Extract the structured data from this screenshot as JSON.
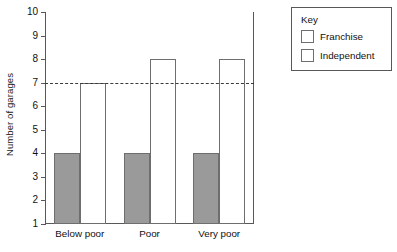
{
  "chart_data": {
    "type": "bar",
    "title": "",
    "xlabel": "",
    "ylabel": "Number of garages",
    "categories": [
      "Below poor",
      "Poor",
      "Very poor"
    ],
    "series": [
      {
        "name": "Franchise",
        "values": [
          4,
          4,
          4
        ],
        "color": "#9a9a9a"
      },
      {
        "name": "Independent",
        "values": [
          7,
          8,
          8
        ],
        "color": "#ffffff"
      }
    ],
    "ylim": [
      1,
      10
    ],
    "y_ticks": [
      1,
      2,
      3,
      4,
      5,
      6,
      7,
      8,
      9,
      10
    ],
    "grid": false,
    "legend_position": "outside-top-right",
    "annotations": [
      {
        "type": "reference-line",
        "axis": "y",
        "value": 7,
        "style": "dashed"
      }
    ]
  },
  "legend": {
    "title": "Key",
    "entries": [
      {
        "label": "Franchise",
        "swatch": "gray-filled-swatch"
      },
      {
        "label": "Independent",
        "swatch": "white-empty-swatch"
      }
    ]
  },
  "axes": {
    "y_title": "Number of garages",
    "y_tick_labels": [
      "10",
      "9",
      "8",
      "7",
      "6",
      "5",
      "4",
      "3",
      "2",
      "1"
    ],
    "x_tick_labels": [
      "Below poor",
      "Poor",
      "Very poor"
    ]
  },
  "colors": {
    "franchise_fill": "#9a9a9a",
    "independent_fill": "#ffffff",
    "bar_stroke": "#6e6e70",
    "axis": "#58585a",
    "reference_line": "#3a3a3a",
    "text": "#111111",
    "background": "#ffffff"
  }
}
